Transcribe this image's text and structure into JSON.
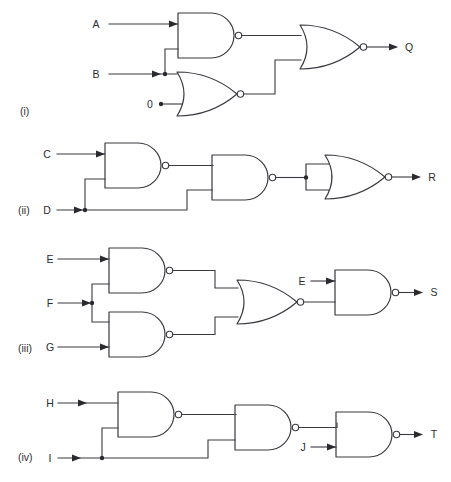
{
  "page": {
    "background": "#ffffff",
    "line_color": "#3a3a40",
    "text_color": "#2b2b30",
    "width": 451,
    "height": 482
  },
  "circuits": [
    {
      "id": "i",
      "label": "(i)",
      "output_label": "Q",
      "inputs": [
        {
          "name": "A",
          "label": "A"
        },
        {
          "name": "B",
          "label": "B"
        },
        {
          "name": "const0",
          "label": "0"
        }
      ],
      "gates": [
        {
          "name": "nand-1",
          "type": "NAND",
          "inputs": [
            "A",
            "B"
          ]
        },
        {
          "name": "nor-1",
          "type": "NOR",
          "inputs": [
            "B",
            "0"
          ]
        },
        {
          "name": "nor-2",
          "type": "NOR",
          "inputs": [
            "nand-1",
            "nor-1"
          ]
        }
      ]
    },
    {
      "id": "ii",
      "label": "(ii)",
      "output_label": "R",
      "inputs": [
        {
          "name": "C",
          "label": "C"
        },
        {
          "name": "D",
          "label": "D"
        }
      ],
      "gates": [
        {
          "name": "nand-1",
          "type": "NAND",
          "inputs": [
            "C",
            "D"
          ]
        },
        {
          "name": "nand-2",
          "type": "NAND",
          "inputs": [
            "nand-1",
            "D"
          ]
        },
        {
          "name": "nor-1",
          "type": "NOR",
          "inputs": [
            "nand-2",
            "nand-2"
          ]
        }
      ]
    },
    {
      "id": "iii",
      "label": "(iii)",
      "output_label": "S",
      "inputs": [
        {
          "name": "E",
          "label": "E"
        },
        {
          "name": "F",
          "label": "F"
        },
        {
          "name": "G",
          "label": "G"
        },
        {
          "name": "E2",
          "label": "E"
        }
      ],
      "gates": [
        {
          "name": "nand-1",
          "type": "NAND",
          "inputs": [
            "E",
            "F"
          ]
        },
        {
          "name": "nand-2",
          "type": "NAND",
          "inputs": [
            "F",
            "G"
          ]
        },
        {
          "name": "nor-1",
          "type": "NOR",
          "inputs": [
            "nand-1",
            "nand-2"
          ]
        },
        {
          "name": "nand-3",
          "type": "NAND",
          "inputs": [
            "E",
            "nor-1"
          ]
        }
      ]
    },
    {
      "id": "iv",
      "label": "(iv)",
      "output_label": "T",
      "inputs": [
        {
          "name": "H",
          "label": "H"
        },
        {
          "name": "I",
          "label": "I"
        },
        {
          "name": "J",
          "label": "J"
        }
      ],
      "gates": [
        {
          "name": "nand-1",
          "type": "NAND",
          "inputs": [
            "H",
            "I"
          ]
        },
        {
          "name": "nand-2",
          "type": "NAND",
          "inputs": [
            "nand-1",
            "I"
          ]
        },
        {
          "name": "nand-3",
          "type": "NAND",
          "inputs": [
            "nand-2",
            "J"
          ]
        }
      ]
    }
  ]
}
